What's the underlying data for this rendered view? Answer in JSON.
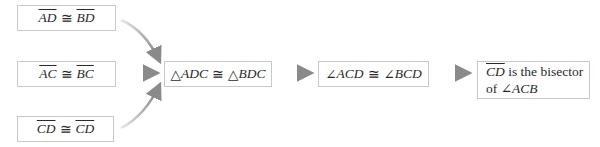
{
  "premises": [
    {
      "left": "AD",
      "op": "≅",
      "right": "BD"
    },
    {
      "left": "AC",
      "op": "≅",
      "right": "BC"
    },
    {
      "left": "CD",
      "op": "≅",
      "right": "CD"
    }
  ],
  "step1": {
    "sym1": "△",
    "left": "ADC",
    "op": "≅",
    "sym2": "△",
    "right": "BDC"
  },
  "step2": {
    "sym1": "∠",
    "left": "ACD",
    "op": "≅",
    "sym2": "∠",
    "right": "BCD"
  },
  "conclusion": {
    "segment": "CD",
    "line1_rest": " is the bisector",
    "line2_prefix": "of ",
    "angle_sym": "∠",
    "angle": "ACB"
  },
  "colors": {
    "arrow": "#8a8a8a",
    "border": "#c8c8c8",
    "text": "#2a2a2a"
  }
}
